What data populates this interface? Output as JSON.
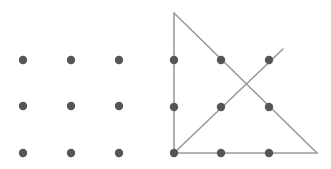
{
  "diagram": {
    "title": "",
    "colors": {
      "dot": "#555555",
      "line": "#9a9a9a",
      "background": "#ffffff"
    },
    "left_panel": {
      "description": "3x3 grid of dots (nine-dot puzzle)",
      "dots": [
        {
          "x": 23,
          "y": 60
        },
        {
          "x": 71,
          "y": 60
        },
        {
          "x": 119,
          "y": 60
        },
        {
          "x": 23,
          "y": 106
        },
        {
          "x": 71,
          "y": 106
        },
        {
          "x": 119,
          "y": 106
        },
        {
          "x": 23,
          "y": 153
        },
        {
          "x": 71,
          "y": 153
        },
        {
          "x": 119,
          "y": 153
        }
      ]
    },
    "right_panel": {
      "description": "3x3 grid of dots connected by four straight lines (nine-dot puzzle solution)",
      "dots": [
        {
          "x": 174,
          "y": 60
        },
        {
          "x": 221,
          "y": 60
        },
        {
          "x": 269,
          "y": 60
        },
        {
          "x": 174,
          "y": 107
        },
        {
          "x": 221,
          "y": 107
        },
        {
          "x": 269,
          "y": 107
        },
        {
          "x": 174,
          "y": 153
        },
        {
          "x": 221,
          "y": 153
        },
        {
          "x": 269,
          "y": 153
        }
      ],
      "lines": [
        {
          "x1": 174,
          "y1": 13,
          "x2": 174,
          "y2": 153
        },
        {
          "x1": 174,
          "y1": 153,
          "x2": 317,
          "y2": 153
        },
        {
          "x1": 174,
          "y1": 13,
          "x2": 317,
          "y2": 153
        },
        {
          "x1": 174,
          "y1": 153,
          "x2": 283,
          "y2": 49
        }
      ]
    }
  }
}
